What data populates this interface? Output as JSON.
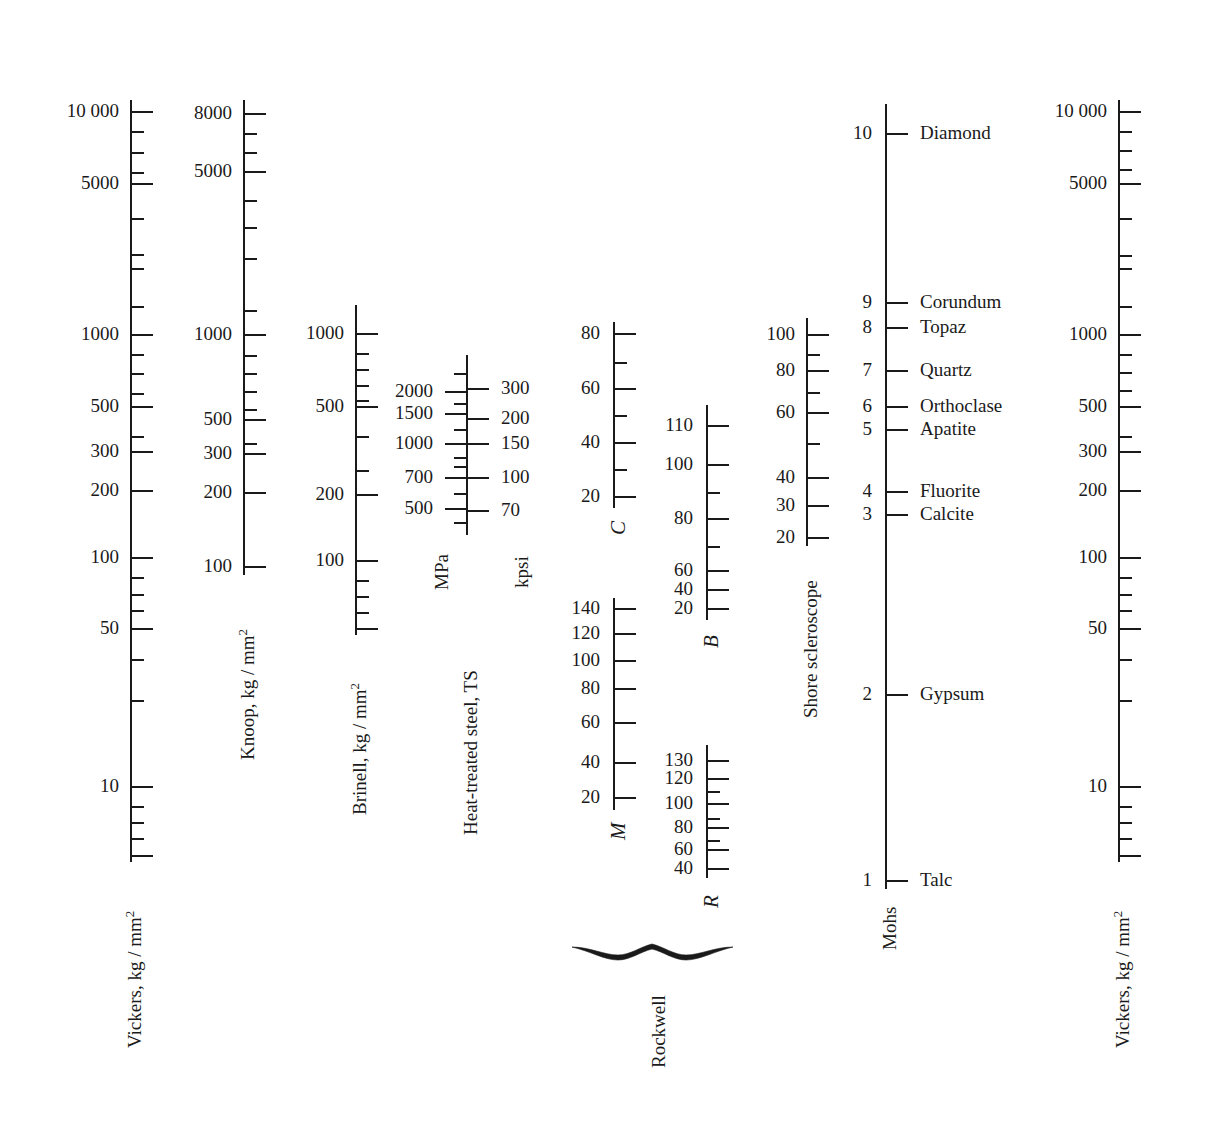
{
  "chart_data": {
    "type": "table",
    "xlabel": "",
    "ylabel": "",
    "grid": false,
    "legend": "none",
    "scales": [
      {
        "name": "vickers-left",
        "caption": "Vickers, kg / mm",
        "caption_sup": "2",
        "axis_type": "log",
        "range": [
          7,
          14000
        ],
        "labeled_ticks": [
          10000,
          5000,
          1000,
          500,
          300,
          200,
          100,
          50,
          10
        ],
        "unlabeled_major_ticks": [],
        "minor_ticks": [
          9000,
          8000,
          7000,
          6000,
          4000,
          3000,
          2000,
          900,
          800,
          700,
          600,
          400,
          150,
          90,
          80,
          70,
          60,
          40,
          30,
          20,
          9,
          8,
          7
        ]
      },
      {
        "name": "knoop",
        "caption": "Knoop, kg / mm",
        "caption_sup": "2",
        "axis_type": "log",
        "range": [
          80,
          9500
        ],
        "labeled_ticks": [
          8000,
          5000,
          1000,
          500,
          300,
          200,
          100
        ],
        "minor_ticks": [
          7000,
          6000,
          4000,
          3000,
          2000,
          900,
          800,
          700,
          600,
          400,
          150
        ]
      },
      {
        "name": "brinell",
        "caption": "Brinell, kg / mm",
        "caption_sup": "2",
        "axis_type": "log",
        "range": [
          55,
          1300
        ],
        "labeled_ticks": [
          1000,
          500,
          200,
          100
        ],
        "minor_ticks": [
          900,
          800,
          700,
          600,
          400,
          300,
          150,
          90,
          80,
          70,
          60
        ]
      },
      {
        "name": "heat-treated-steel",
        "caption": "Heat-treated steel, TS",
        "axis_type": "log",
        "left_unit": "MPa",
        "right_unit": "kpsi",
        "left_labeled_ticks": [
          2000,
          1500,
          1000,
          700,
          500
        ],
        "right_labeled_ticks": [
          300,
          200,
          150,
          100,
          70
        ],
        "minor_ticks_count": 4
      },
      {
        "name": "rockwell-c",
        "caption": "C",
        "caption_italic": true,
        "axis_type": "linear",
        "range": [
          10,
          85
        ],
        "labeled_ticks": [
          80,
          60,
          40,
          20
        ],
        "minor_ticks": [
          70,
          50,
          30
        ]
      },
      {
        "name": "rockwell-b",
        "caption": "B",
        "caption_italic": true,
        "axis_type": "linear",
        "range": [
          10,
          120
        ],
        "labeled_ticks": [
          110,
          100,
          80,
          60,
          40,
          20
        ],
        "minor_ticks": [
          90,
          70
        ]
      },
      {
        "name": "rockwell-m",
        "caption": "M",
        "caption_italic": true,
        "axis_type": "linear",
        "range": [
          10,
          150
        ],
        "labeled_ticks": [
          140,
          120,
          100,
          80,
          60,
          40,
          20
        ],
        "minor_ticks": []
      },
      {
        "name": "rockwell-r",
        "caption": "R",
        "caption_italic": true,
        "axis_type": "linear",
        "range": [
          30,
          140
        ],
        "labeled_ticks": [
          130,
          120,
          100,
          80,
          60,
          40
        ],
        "minor_ticks": [
          110,
          90,
          70,
          50
        ]
      },
      {
        "name": "shore-scleroscope",
        "caption": "Shore scleroscope",
        "axis_type": "linear",
        "range": [
          15,
          108
        ],
        "labeled_ticks": [
          100,
          80,
          60,
          40,
          30,
          20
        ],
        "minor_ticks": [
          90,
          70,
          50
        ]
      },
      {
        "name": "mohs",
        "caption": "Mohs",
        "axis_type": "mineral",
        "range": [
          1,
          10
        ],
        "labeled_ticks": [
          10,
          9,
          8,
          7,
          6,
          5,
          4,
          3,
          2,
          1
        ],
        "minerals": [
          {
            "value": 10,
            "name": "Diamond"
          },
          {
            "value": 9,
            "name": "Corundum"
          },
          {
            "value": 8,
            "name": "Topaz"
          },
          {
            "value": 7,
            "name": "Quartz"
          },
          {
            "value": 6,
            "name": "Orthoclase"
          },
          {
            "value": 5,
            "name": "Apatite"
          },
          {
            "value": 4,
            "name": "Fluorite"
          },
          {
            "value": 3,
            "name": "Calcite"
          },
          {
            "value": 2,
            "name": "Gypsum"
          },
          {
            "value": 1,
            "name": "Talc"
          }
        ]
      },
      {
        "name": "vickers-right",
        "caption": "Vickers, kg / mm",
        "caption_sup": "2",
        "axis_type": "log",
        "range": [
          7,
          14000
        ],
        "labeled_ticks": [
          10000,
          5000,
          1000,
          500,
          300,
          200,
          100,
          50,
          10
        ],
        "minor_ticks": [
          9000,
          8000,
          7000,
          6000,
          4000,
          3000,
          2000,
          900,
          800,
          700,
          600,
          400,
          150,
          90,
          80,
          70,
          60,
          40,
          30,
          20,
          9,
          8,
          7
        ]
      }
    ],
    "group_brace": {
      "label": "Rockwell",
      "members": [
        "C",
        "B",
        "M",
        "R"
      ]
    }
  },
  "vickers_left": {
    "caption": "Vickers, kg / mm",
    "caption_sup": "2",
    "ticks": [
      {
        "label": "10 000",
        "y": 111,
        "size": "major"
      },
      {
        "label": "",
        "y": 131,
        "size": "minor"
      },
      {
        "label": "",
        "y": 152,
        "size": "minor"
      },
      {
        "label": "",
        "y": 172,
        "size": "minor"
      },
      {
        "label": "5000",
        "y": 183,
        "size": "major"
      },
      {
        "label": "",
        "y": 218,
        "size": "minor"
      },
      {
        "label": "",
        "y": 254,
        "size": "minor"
      },
      {
        "label": "",
        "y": 268,
        "size": "minor"
      },
      {
        "label": "",
        "y": 306,
        "size": "minor"
      },
      {
        "label": "1000",
        "y": 334,
        "size": "major"
      },
      {
        "label": "",
        "y": 354,
        "size": "minor"
      },
      {
        "label": "",
        "y": 373,
        "size": "minor"
      },
      {
        "label": "",
        "y": 393,
        "size": "minor"
      },
      {
        "label": "500",
        "y": 406,
        "size": "major"
      },
      {
        "label": "",
        "y": 436,
        "size": "minor"
      },
      {
        "label": "300",
        "y": 451,
        "size": "major"
      },
      {
        "label": "200",
        "y": 490,
        "size": "major"
      },
      {
        "label": "100",
        "y": 557,
        "size": "major"
      },
      {
        "label": "",
        "y": 577,
        "size": "minor"
      },
      {
        "label": "",
        "y": 594,
        "size": "minor"
      },
      {
        "label": "",
        "y": 610,
        "size": "minor"
      },
      {
        "label": "50",
        "y": 628,
        "size": "major"
      },
      {
        "label": "",
        "y": 659,
        "size": "minor"
      },
      {
        "label": "",
        "y": 700,
        "size": "minor"
      },
      {
        "label": "10",
        "y": 786,
        "size": "major"
      },
      {
        "label": "",
        "y": 806,
        "size": "minor"
      },
      {
        "label": "",
        "y": 822,
        "size": "minor"
      },
      {
        "label": "",
        "y": 838,
        "size": "minor"
      },
      {
        "label": "",
        "y": 855,
        "size": "major"
      }
    ]
  },
  "knoop": {
    "caption": "Knoop, kg / mm",
    "caption_sup": "2",
    "ticks": [
      {
        "label": "8000",
        "y": 113,
        "size": "major"
      },
      {
        "label": "",
        "y": 133,
        "size": "minor"
      },
      {
        "label": "",
        "y": 152,
        "size": "minor"
      },
      {
        "label": "5000",
        "y": 171,
        "size": "major"
      },
      {
        "label": "",
        "y": 200,
        "size": "minor"
      },
      {
        "label": "",
        "y": 227,
        "size": "minor"
      },
      {
        "label": "",
        "y": 258,
        "size": "minor"
      },
      {
        "label": "",
        "y": 310,
        "size": "minor"
      },
      {
        "label": "1000",
        "y": 334,
        "size": "major"
      },
      {
        "label": "",
        "y": 355,
        "size": "minor"
      },
      {
        "label": "",
        "y": 373,
        "size": "minor"
      },
      {
        "label": "",
        "y": 391,
        "size": "minor"
      },
      {
        "label": "",
        "y": 409,
        "size": "minor"
      },
      {
        "label": "500",
        "y": 419,
        "size": "major"
      },
      {
        "label": "",
        "y": 443,
        "size": "minor"
      },
      {
        "label": "300",
        "y": 453,
        "size": "major"
      },
      {
        "label": "200",
        "y": 492,
        "size": "major"
      },
      {
        "label": "100",
        "y": 566,
        "size": "major"
      }
    ]
  },
  "brinell": {
    "caption": "Brinell, kg / mm",
    "caption_sup": "2",
    "ticks": [
      {
        "label": "1000",
        "y": 333,
        "size": "major"
      },
      {
        "label": "",
        "y": 353,
        "size": "minor"
      },
      {
        "label": "",
        "y": 369,
        "size": "minor"
      },
      {
        "label": "",
        "y": 385,
        "size": "minor"
      },
      {
        "label": "",
        "y": 400,
        "size": "minor"
      },
      {
        "label": "500",
        "y": 406,
        "size": "major"
      },
      {
        "label": "",
        "y": 436,
        "size": "minor"
      },
      {
        "label": "",
        "y": 470,
        "size": "minor"
      },
      {
        "label": "200",
        "y": 494,
        "size": "major"
      },
      {
        "label": "100",
        "y": 560,
        "size": "major"
      },
      {
        "label": "",
        "y": 580,
        "size": "minor"
      },
      {
        "label": "",
        "y": 596,
        "size": "minor"
      },
      {
        "label": "",
        "y": 612,
        "size": "minor"
      },
      {
        "label": "",
        "y": 628,
        "size": "major"
      }
    ]
  },
  "heat_treated": {
    "caption": "Heat-treated steel, TS",
    "left_unit": "MPa",
    "right_unit": "kpsi",
    "left_ticks": [
      {
        "label": "2000",
        "y": 391
      },
      {
        "label": "1500",
        "y": 413
      },
      {
        "label": "1000",
        "y": 443
      },
      {
        "label": "700",
        "y": 477
      },
      {
        "label": "500",
        "y": 508
      }
    ],
    "right_ticks": [
      {
        "label": "300",
        "y": 388
      },
      {
        "label": "200",
        "y": 418
      },
      {
        "label": "150",
        "y": 443
      },
      {
        "label": "100",
        "y": 477
      },
      {
        "label": "70",
        "y": 510
      }
    ],
    "minor_ticks": [
      {
        "y": 373
      },
      {
        "y": 403
      },
      {
        "y": 429
      },
      {
        "y": 457
      },
      {
        "y": 466
      },
      {
        "y": 493
      },
      {
        "y": 522
      }
    ]
  },
  "rockwell_c": {
    "caption": "C",
    "ticks": [
      {
        "label": "80",
        "y": 333,
        "size": "major"
      },
      {
        "label": "",
        "y": 362,
        "size": "minor"
      },
      {
        "label": "60",
        "y": 388,
        "size": "major"
      },
      {
        "label": "",
        "y": 415,
        "size": "minor"
      },
      {
        "label": "40",
        "y": 442,
        "size": "major"
      },
      {
        "label": "",
        "y": 469,
        "size": "minor"
      },
      {
        "label": "20",
        "y": 496,
        "size": "major"
      }
    ]
  },
  "rockwell_b": {
    "caption": "B",
    "ticks": [
      {
        "label": "110",
        "y": 425,
        "size": "major"
      },
      {
        "label": "100",
        "y": 464,
        "size": "major"
      },
      {
        "label": "",
        "y": 492,
        "size": "minor"
      },
      {
        "label": "80",
        "y": 518,
        "size": "major"
      },
      {
        "label": "",
        "y": 546,
        "size": "minor"
      },
      {
        "label": "60",
        "y": 570,
        "size": "major"
      },
      {
        "label": "40",
        "y": 589,
        "size": "major"
      },
      {
        "label": "20",
        "y": 608,
        "size": "major"
      }
    ]
  },
  "rockwell_m": {
    "caption": "M",
    "ticks": [
      {
        "label": "140",
        "y": 608,
        "size": "major"
      },
      {
        "label": "120",
        "y": 633,
        "size": "major"
      },
      {
        "label": "100",
        "y": 660,
        "size": "major"
      },
      {
        "label": "80",
        "y": 688,
        "size": "major"
      },
      {
        "label": "60",
        "y": 722,
        "size": "major"
      },
      {
        "label": "40",
        "y": 762,
        "size": "major"
      },
      {
        "label": "20",
        "y": 797,
        "size": "major"
      }
    ]
  },
  "rockwell_r": {
    "caption": "R",
    "ticks": [
      {
        "label": "130",
        "y": 760,
        "size": "major"
      },
      {
        "label": "120",
        "y": 778,
        "size": "major"
      },
      {
        "label": "",
        "y": 791,
        "size": "minor"
      },
      {
        "label": "100",
        "y": 803,
        "size": "major"
      },
      {
        "label": "",
        "y": 818,
        "size": "minor"
      },
      {
        "label": "80",
        "y": 827,
        "size": "major"
      },
      {
        "label": "",
        "y": 840,
        "size": "minor"
      },
      {
        "label": "60",
        "y": 849,
        "size": "major"
      },
      {
        "label": "40",
        "y": 868,
        "size": "major"
      }
    ]
  },
  "rockwell_group": {
    "label": "Rockwell"
  },
  "shore": {
    "caption": "Shore scleroscope",
    "ticks": [
      {
        "label": "100",
        "y": 334,
        "size": "major"
      },
      {
        "label": "",
        "y": 354,
        "size": "minor"
      },
      {
        "label": "80",
        "y": 370,
        "size": "major"
      },
      {
        "label": "",
        "y": 392,
        "size": "minor"
      },
      {
        "label": "60",
        "y": 412,
        "size": "major"
      },
      {
        "label": "",
        "y": 443,
        "size": "minor"
      },
      {
        "label": "40",
        "y": 477,
        "size": "major"
      },
      {
        "label": "30",
        "y": 505,
        "size": "major"
      },
      {
        "label": "20",
        "y": 537,
        "size": "major"
      }
    ]
  },
  "mohs": {
    "caption": "Mohs",
    "ticks": [
      {
        "label": "10",
        "y": 133,
        "mineral": "Diamond"
      },
      {
        "label": "9",
        "y": 302,
        "mineral": "Corundum"
      },
      {
        "label": "8",
        "y": 327,
        "mineral": "Topaz"
      },
      {
        "label": "7",
        "y": 370,
        "mineral": "Quartz"
      },
      {
        "label": "6",
        "y": 406,
        "mineral": "Orthoclase"
      },
      {
        "label": "5",
        "y": 429,
        "mineral": "Apatite"
      },
      {
        "label": "4",
        "y": 491,
        "mineral": "Fluorite"
      },
      {
        "label": "3",
        "y": 514,
        "mineral": "Calcite"
      },
      {
        "label": "2",
        "y": 694,
        "mineral": "Gypsum"
      },
      {
        "label": "1",
        "y": 880,
        "mineral": "Talc"
      }
    ]
  },
  "vickers_right": {
    "caption": "Vickers, kg / mm",
    "caption_sup": "2",
    "ticks": [
      {
        "label": "10 000",
        "y": 111,
        "size": "major"
      },
      {
        "label": "",
        "y": 131,
        "size": "minor"
      },
      {
        "label": "",
        "y": 150,
        "size": "minor"
      },
      {
        "label": "",
        "y": 169,
        "size": "minor"
      },
      {
        "label": "5000",
        "y": 183,
        "size": "major"
      },
      {
        "label": "",
        "y": 218,
        "size": "minor"
      },
      {
        "label": "",
        "y": 255,
        "size": "minor"
      },
      {
        "label": "",
        "y": 268,
        "size": "minor"
      },
      {
        "label": "",
        "y": 306,
        "size": "minor"
      },
      {
        "label": "1000",
        "y": 334,
        "size": "major"
      },
      {
        "label": "",
        "y": 354,
        "size": "minor"
      },
      {
        "label": "",
        "y": 372,
        "size": "minor"
      },
      {
        "label": "",
        "y": 390,
        "size": "minor"
      },
      {
        "label": "500",
        "y": 406,
        "size": "major"
      },
      {
        "label": "",
        "y": 436,
        "size": "minor"
      },
      {
        "label": "300",
        "y": 451,
        "size": "major"
      },
      {
        "label": "200",
        "y": 490,
        "size": "major"
      },
      {
        "label": "100",
        "y": 557,
        "size": "major"
      },
      {
        "label": "",
        "y": 577,
        "size": "minor"
      },
      {
        "label": "",
        "y": 594,
        "size": "minor"
      },
      {
        "label": "",
        "y": 610,
        "size": "minor"
      },
      {
        "label": "50",
        "y": 628,
        "size": "major"
      },
      {
        "label": "",
        "y": 659,
        "size": "minor"
      },
      {
        "label": "",
        "y": 700,
        "size": "minor"
      },
      {
        "label": "10",
        "y": 786,
        "size": "major"
      },
      {
        "label": "",
        "y": 806,
        "size": "minor"
      },
      {
        "label": "",
        "y": 822,
        "size": "minor"
      },
      {
        "label": "",
        "y": 838,
        "size": "minor"
      },
      {
        "label": "",
        "y": 855,
        "size": "major"
      }
    ]
  }
}
